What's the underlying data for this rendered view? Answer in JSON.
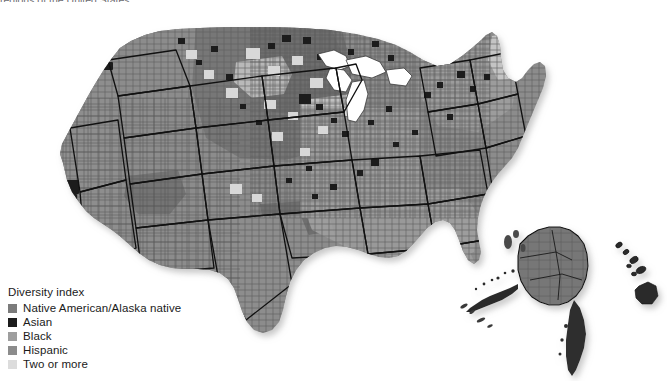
{
  "caption": "regions of the United States.",
  "legend": {
    "title": "Diversity index",
    "items": [
      {
        "label": "Native American/Alaska native",
        "color": "#7b7b7b",
        "swatch_name": "swatch-native-american"
      },
      {
        "label": "Asian",
        "color": "#1c1c1c",
        "swatch_name": "swatch-asian"
      },
      {
        "label": "Black",
        "color": "#9e9e9e",
        "swatch_name": "swatch-black"
      },
      {
        "label": "Hispanic",
        "color": "#8c8c8c",
        "swatch_name": "swatch-hispanic"
      },
      {
        "label": "Two or more",
        "color": "#dcdcdc",
        "swatch_name": "swatch-two-or-more"
      }
    ]
  },
  "map": {
    "title": "United States county-level diversity index choropleth",
    "projection": "albers-usa",
    "background": "#ffffff",
    "water_color": "#ffffff",
    "county_stroke": "#5a5a5a",
    "state_stroke": "#111111",
    "insets": [
      {
        "name": "alaska",
        "dominant": "Native American/Alaska native"
      },
      {
        "name": "hawaii",
        "dominant": "Asian"
      }
    ],
    "regions": [
      {
        "name": "great-plains-northern",
        "dominant": "Native American/Alaska native"
      },
      {
        "name": "southwest",
        "dominant": "Hispanic"
      },
      {
        "name": "southeast",
        "dominant": "Black"
      },
      {
        "name": "northeast",
        "dominant": "Black"
      },
      {
        "name": "upper-midwest",
        "dominant": "Two or more"
      },
      {
        "name": "pacific-coast",
        "dominant": "Hispanic"
      }
    ]
  }
}
